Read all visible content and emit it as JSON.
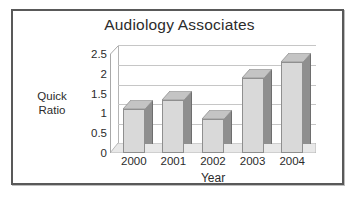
{
  "chart_data": {
    "type": "bar",
    "title": "Audiology Associates",
    "xlabel": "Year",
    "ylabel": "Quick Ratio",
    "ylabel_lines": [
      "Quick",
      "Ratio"
    ],
    "categories": [
      "2000",
      "2001",
      "2002",
      "2003",
      "2004"
    ],
    "values": [
      1.1,
      1.35,
      0.85,
      1.9,
      2.3
    ],
    "series": [
      {
        "name": "Quick Ratio",
        "values": [
          1.1,
          1.35,
          0.85,
          1.9,
          2.3
        ]
      }
    ],
    "ylim": [
      0,
      2.5
    ],
    "yticks": [
      "0",
      "0.5",
      "1",
      "1.5",
      "2",
      "2.5"
    ],
    "ytick_values": [
      0,
      0.5,
      1,
      1.5,
      2,
      2.5
    ],
    "grid": true,
    "legend": false,
    "legend_position": "none",
    "style": "3d-column",
    "colors": {
      "bar_face": "#d9d9d9",
      "bar_side": "#8f8f8f",
      "bar_top": "#c4c4c4",
      "bar_outline": "#8f8f8f",
      "gridline": "#c6c6c6",
      "axis": "#a8a8a8",
      "frame_border": "#595959",
      "background": "#ffffff",
      "text": "#2b2b2b"
    }
  }
}
